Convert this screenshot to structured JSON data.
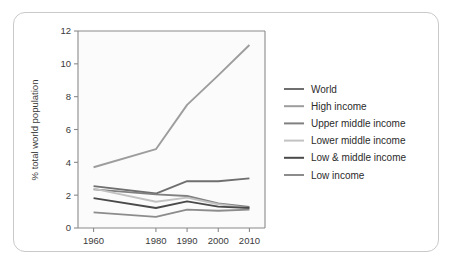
{
  "chart_data": {
    "type": "line",
    "title": "",
    "xlabel": "",
    "ylabel": "% total world population",
    "x": [
      1960,
      1980,
      1990,
      2000,
      2010
    ],
    "xtick_labels": [
      "1960",
      "1980",
      "1990",
      "2000",
      "2010"
    ],
    "ytick_labels": [
      "0",
      "2",
      "4",
      "6",
      "8",
      "10",
      "12"
    ],
    "ytick_values": [
      0,
      2,
      4,
      6,
      8,
      10,
      12
    ],
    "ylim": [
      0,
      12
    ],
    "xlim": [
      1955,
      2015
    ],
    "grid": false,
    "legend_position": "right",
    "series": [
      {
        "name": "World",
        "color": "#6f6f6f",
        "values": [
          2.55,
          2.1,
          2.85,
          2.85,
          3.02
        ]
      },
      {
        "name": "High income",
        "color": "#9d9d9d",
        "values": [
          3.7,
          4.8,
          7.5,
          9.3,
          11.15
        ]
      },
      {
        "name": "Upper middle income",
        "color": "#808080",
        "values": [
          2.35,
          2.05,
          1.95,
          1.5,
          1.28
        ]
      },
      {
        "name": "Lower middle income",
        "color": "#c2c2c2",
        "values": [
          2.4,
          1.6,
          1.85,
          1.45,
          1.2
        ]
      },
      {
        "name": "Low & middle income",
        "color": "#4a4a4a",
        "values": [
          1.82,
          1.22,
          1.62,
          1.3,
          1.22
        ]
      },
      {
        "name": "Low income",
        "color": "#8c8c8c",
        "values": [
          0.95,
          0.68,
          1.12,
          1.05,
          1.12
        ]
      }
    ]
  },
  "legend": {
    "items": [
      {
        "label": "World"
      },
      {
        "label": "High income"
      },
      {
        "label": "Upper middle income"
      },
      {
        "label": "Lower middle income"
      },
      {
        "label": "Low & middle income"
      },
      {
        "label": "Low income"
      }
    ]
  },
  "axes": {
    "y_title": "% total world population"
  }
}
